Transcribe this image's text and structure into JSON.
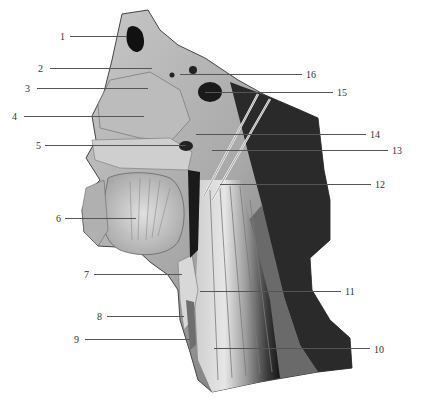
{
  "figure": {
    "labels": [
      {
        "num": "1",
        "side": "left",
        "text_x": 60,
        "text_y": 32,
        "line_x1": 70,
        "line_x2": 126,
        "line_y": 36
      },
      {
        "num": "2",
        "side": "left",
        "text_x": 38,
        "text_y": 64,
        "line_x1": 50,
        "line_x2": 152,
        "line_y": 68
      },
      {
        "num": "3",
        "side": "left",
        "text_x": 25,
        "text_y": 84,
        "line_x1": 37,
        "line_x2": 148,
        "line_y": 88
      },
      {
        "num": "4",
        "side": "left",
        "text_x": 12,
        "text_y": 112,
        "line_x1": 24,
        "line_x2": 144,
        "line_y": 116
      },
      {
        "num": "5",
        "side": "left",
        "text_x": 36,
        "text_y": 141,
        "line_x1": 45,
        "line_x2": 186,
        "line_y": 145
      },
      {
        "num": "6",
        "side": "left",
        "text_x": 56,
        "text_y": 214,
        "line_x1": 65,
        "line_x2": 136,
        "line_y": 218
      },
      {
        "num": "7",
        "side": "left",
        "text_x": 84,
        "text_y": 270,
        "line_x1": 94,
        "line_x2": 182,
        "line_y": 274
      },
      {
        "num": "8",
        "side": "left",
        "text_x": 97,
        "text_y": 312,
        "line_x1": 107,
        "line_x2": 184,
        "line_y": 316
      },
      {
        "num": "9",
        "side": "left",
        "text_x": 74,
        "text_y": 335,
        "line_x1": 85,
        "line_x2": 190,
        "line_y": 339
      },
      {
        "num": "10",
        "side": "right",
        "text_x": 374,
        "text_y": 345,
        "line_x1": 214,
        "line_x2": 370,
        "line_y": 348
      },
      {
        "num": "11",
        "side": "right",
        "text_x": 345,
        "text_y": 287,
        "line_x1": 200,
        "line_x2": 341,
        "line_y": 291
      },
      {
        "num": "12",
        "side": "right",
        "text_x": 375,
        "text_y": 180,
        "line_x1": 220,
        "line_x2": 371,
        "line_y": 184
      },
      {
        "num": "13",
        "side": "right",
        "text_x": 392,
        "text_y": 146,
        "line_x1": 212,
        "line_x2": 388,
        "line_y": 150
      },
      {
        "num": "14",
        "side": "right",
        "text_x": 370,
        "text_y": 130,
        "line_x1": 196,
        "line_x2": 366,
        "line_y": 134
      },
      {
        "num": "15",
        "side": "right",
        "text_x": 337,
        "text_y": 88,
        "line_x1": 205,
        "line_x2": 333,
        "line_y": 92
      },
      {
        "num": "16",
        "side": "right",
        "text_x": 306,
        "text_y": 70,
        "line_x1": 180,
        "line_x2": 302,
        "line_y": 74
      }
    ],
    "colors": {
      "background": "#ffffff",
      "tissue_light": "#d9d9d9",
      "tissue_mid": "#9a9a9a",
      "tissue_dark": "#3a3a3a",
      "cavity": "#111111",
      "label_text": "#333333",
      "leader_line": "#555555"
    }
  }
}
